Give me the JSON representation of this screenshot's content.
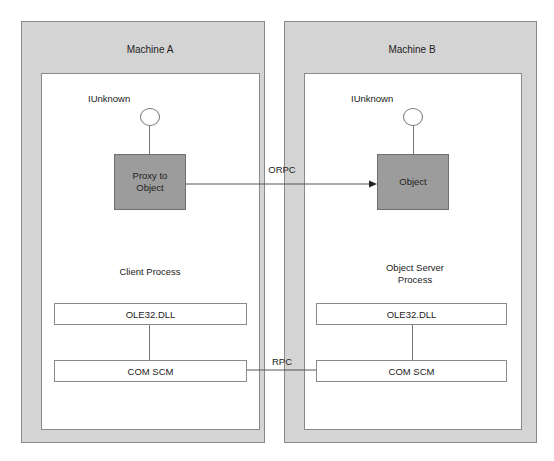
{
  "diagram": {
    "machines": [
      {
        "title": "Machine A",
        "process_label": "Client Process",
        "interface_label": "IUnknown",
        "object_label": "Proxy to Object",
        "object_lines": [
          "Proxy to",
          "Object"
        ],
        "layers": [
          "OLE32.DLL",
          "COM SCM"
        ]
      },
      {
        "title": "Machine B",
        "process_label": "Object Server Process",
        "process_lines": [
          "Object Server",
          "Process"
        ],
        "interface_label": "IUnknown",
        "object_label": "Object",
        "layers": [
          "OLE32.DLL",
          "COM SCM"
        ]
      }
    ],
    "connections": [
      {
        "from": "Proxy to Object",
        "to": "Object",
        "label": "ORPC",
        "arrow": true
      },
      {
        "from": "COM SCM (Machine A)",
        "to": "COM SCM (Machine B)",
        "label": "RPC",
        "arrow": false
      }
    ],
    "colors": {
      "machine_fill": "#d4d4d4",
      "process_fill": "#ffffff",
      "object_fill": "#9c9c9c",
      "border": "#8a8a8a"
    }
  }
}
